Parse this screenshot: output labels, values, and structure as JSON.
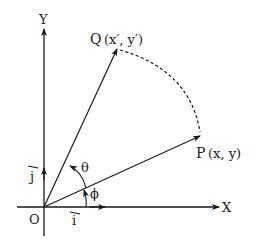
{
  "diagram": {
    "axes": {
      "x_label": "X",
      "y_label": "Y",
      "origin_label": "O"
    },
    "unit_vectors": {
      "i_label": "i",
      "j_label": "j"
    },
    "points": {
      "P": {
        "name": "P",
        "coords": "(x, y)"
      },
      "Q": {
        "name": "Q",
        "coords": "(x′, y′)"
      }
    },
    "angles": {
      "theta": "θ",
      "phi": "ϕ"
    },
    "colors": {
      "ink": "#1a1a1a",
      "background": "#ffffff"
    }
  }
}
